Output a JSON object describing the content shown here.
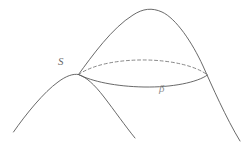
{
  "figure": {
    "kind": "mathematical-diagram",
    "background_color": "#ffffff",
    "canvas": {
      "width": 252,
      "height": 142
    },
    "stroke": {
      "solid_color": "#585858",
      "dashed_color": "#7a7a7a",
      "width": 0.9,
      "dash_pattern": "3 2.6"
    },
    "labels": [
      {
        "name": "point-label-s",
        "text": "S",
        "x": 58,
        "y": 56,
        "font_size": 11,
        "color": "#6a6a6a"
      },
      {
        "name": "curve-label-beta",
        "text": "β",
        "x": 159,
        "y": 83,
        "font_size": 11,
        "color": "#8d8d8d"
      }
    ],
    "curves": [
      {
        "name": "large-dome-curve",
        "style": "solid",
        "description": "Large outer dome: rises from singular point S to apex then descends to lower right corner.",
        "path": "M 78.5 74.5 C 92 56 112 28 133 15 C 143 8.5 152 7.5 162 12 C 176 18.5 192 42 203 66 C 212 86 226 118 240 141"
      },
      {
        "name": "small-dome-left-flank",
        "style": "solid",
        "description": "Left smaller dome: from lower-left tail rising to its apex at S.",
        "path": "M 13.5 132 C 26 114 44 92 58 82 C 66 76 73 73.5 78.5 74.5"
      },
      {
        "name": "small-dome-right-flank",
        "style": "solid",
        "description": "Right flank of the smaller dome descending from S toward the bottom middle.",
        "path": "M 78.5 74.5 C 86 77 94 84 104 97 C 114 110 126 127 135 138"
      },
      {
        "name": "intersection-ellipse-back-arc",
        "style": "dashed",
        "description": "Hidden (back) half of the intersection ellipse, drawn dashed, from S to the right vertex.",
        "path": "M 78.5 74.5 C 94 64 120 59.5 147 60 C 172 60.5 196 66 207.5 75"
      },
      {
        "name": "intersection-ellipse-front-arc",
        "style": "solid",
        "description": "Visible (front) half of the intersection ellipse labelled beta, from S to the right vertex.",
        "path": "M 78.5 74.5 C 92 81.5 116 86.5 144 87 C 172 87.5 197 82.5 207.5 75"
      }
    ],
    "points": [
      {
        "name": "singular-point-s",
        "label": "S",
        "x": 78.5,
        "y": 74.5
      },
      {
        "name": "ellipse-right-vertex",
        "label": "",
        "x": 207.5,
        "y": 75
      }
    ]
  }
}
